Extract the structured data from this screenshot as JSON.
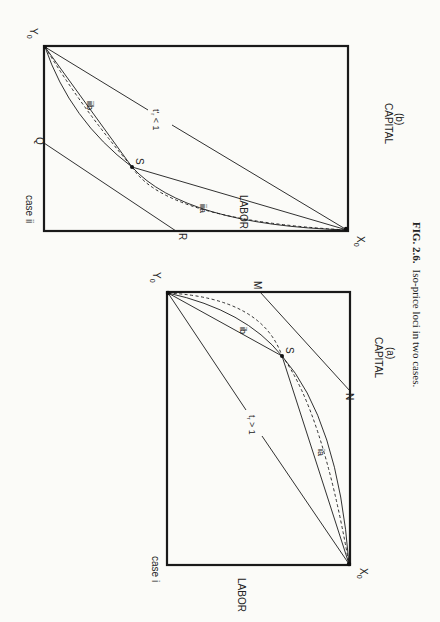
{
  "figure": {
    "caption_number": "FIG. 2.6.",
    "caption_text": "Iso-price loci in two cases.",
    "orientation": "rotated 90 degrees clockwise"
  },
  "panel_a": {
    "case_label": "case i",
    "x_axis_label": "CAPITAL",
    "sub_label": "(a)",
    "y_axis_label": "LABOR",
    "origin_x": "X",
    "origin_x_sub": "0",
    "origin_y": "Y",
    "origin_y_sub": "0",
    "point_s": "S",
    "point_m": "M",
    "point_n": "N",
    "curve_ia": "ia",
    "curve_ib": "ib",
    "ratio_label": "t",
    "ratio_sub": "r",
    "ratio_rel": " > 1"
  },
  "panel_b": {
    "case_label": "case ii",
    "x_axis_label": "CAPITAL",
    "sub_label": "(b)",
    "y_axis_label": "LABOR",
    "origin_x": "X",
    "origin_x_sub": "0",
    "origin_y": "Y",
    "origin_y_sub": "0",
    "point_s": "S",
    "point_q": "Q",
    "point_r": "R",
    "curve_iia": "iia",
    "curve_iib": "iib",
    "ratio_label": "t",
    "ratio_sub": "r",
    "ratio_prime": "'",
    "ratio_rel": " < 1"
  }
}
